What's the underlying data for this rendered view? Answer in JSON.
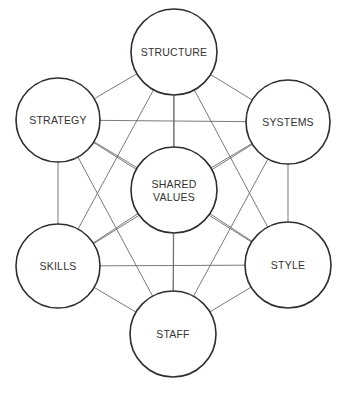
{
  "diagram": {
    "type": "fully-connected network",
    "colors": {
      "background": "#ffffff",
      "circle_stroke": "#2e2e2e",
      "edge_stroke": "#6a6a6a",
      "text": "#333333"
    },
    "nodes": [
      {
        "id": "structure",
        "lines": [
          "STRUCTURE"
        ],
        "cx": 174,
        "cy": 52,
        "r": 43
      },
      {
        "id": "strategy",
        "lines": [
          "STRATEGY"
        ],
        "cx": 58,
        "cy": 120,
        "r": 42
      },
      {
        "id": "systems",
        "lines": [
          "SYSTEMS"
        ],
        "cx": 288,
        "cy": 122,
        "r": 42
      },
      {
        "id": "shared-values",
        "lines": [
          "SHARED",
          "VALUES"
        ],
        "cx": 174,
        "cy": 190,
        "r": 43
      },
      {
        "id": "skills",
        "lines": [
          "SKILLS"
        ],
        "cx": 58,
        "cy": 266,
        "r": 42
      },
      {
        "id": "style",
        "lines": [
          "STYLE"
        ],
        "cx": 288,
        "cy": 265,
        "r": 43
      },
      {
        "id": "staff",
        "lines": [
          "STAFF"
        ],
        "cx": 173,
        "cy": 334,
        "r": 43
      }
    ],
    "edges": "all pairs connected"
  }
}
